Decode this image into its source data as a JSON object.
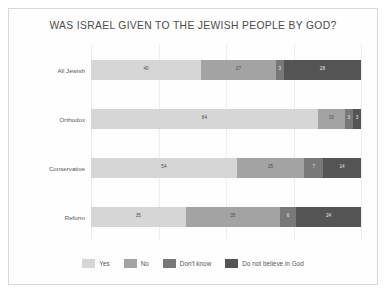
{
  "chart_data": {
    "type": "bar",
    "subtype": "stacked-horizontal-100pct",
    "title": "WAS ISRAEL GIVEN TO THE JEWISH PEOPLE BY GOD?",
    "xlabel": "",
    "ylabel": "",
    "xlim": [
      0,
      100
    ],
    "grid": true,
    "legend_position": "bottom",
    "categories": [
      "All Jewish",
      "Orthodox",
      "Conservative",
      "Reform"
    ],
    "series": [
      {
        "name": "Yes",
        "color": "#d6d6d6",
        "values": [
          40,
          84,
          54,
          35
        ]
      },
      {
        "name": "No",
        "color": "#a3a3a3",
        "values": [
          27,
          10,
          25,
          35
        ]
      },
      {
        "name": "Don't know",
        "color": "#787878",
        "values": [
          3,
          3,
          7,
          6
        ]
      },
      {
        "name": "Do not believe in God",
        "color": "#545454",
        "values": [
          28,
          3,
          14,
          24
        ]
      }
    ]
  },
  "legend": {
    "items": [
      {
        "label": "Yes"
      },
      {
        "label": "No"
      },
      {
        "label": "Don't know"
      },
      {
        "label": "Do not believe in God"
      }
    ]
  }
}
